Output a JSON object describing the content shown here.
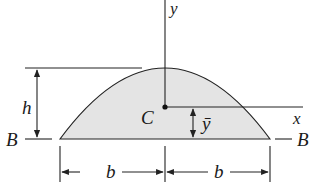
{
  "diagram": {
    "type": "parabolic-segment-cross-section",
    "colors": {
      "fill": "#e4e4e4",
      "stroke": "#222222",
      "background": "#ffffff"
    },
    "labels": {
      "y_axis": "y",
      "x_axis": "x",
      "centroid": "C",
      "height": "h",
      "centroid_distance": "ȳ",
      "base_left": "B",
      "base_right": "B",
      "half_width_left": "b",
      "half_width_right": "b"
    }
  }
}
